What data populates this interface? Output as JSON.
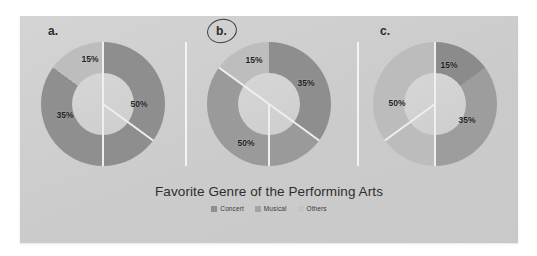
{
  "chart_data": {
    "type": "pie",
    "title": "Favorite Genre of the Performing Arts",
    "subtitle": "",
    "xlabel": "",
    "ylabel": "",
    "legend_position": "bottom",
    "grid": false,
    "categories": [
      "Concert",
      "Musical",
      "Others"
    ],
    "colors": {
      "concert": "#8e8e8e",
      "musical": "#a3a3a3",
      "others": "#bdbdbd",
      "separator": "#efefef",
      "card_background": "#cfcfcf",
      "page_background": "#ffffff",
      "text": "#2e2e2e"
    },
    "charts": [
      {
        "id": "a",
        "label": "a.",
        "annotated": false,
        "slices": [
          {
            "category": "Concert",
            "value": 50,
            "label": "50%",
            "color": "#8e8e8e",
            "start_deg": 0,
            "sweep_deg": 180
          },
          {
            "category": "Musical",
            "value": 35,
            "label": "35%",
            "color": "#8f8f8f",
            "start_deg": 180,
            "sweep_deg": 126
          },
          {
            "category": "Others",
            "value": 15,
            "label": "15%",
            "color": "#bdbdbd",
            "start_deg": 306,
            "sweep_deg": 54
          }
        ]
      },
      {
        "id": "b",
        "label": "b.",
        "annotated": true,
        "annotation": "hand-drawn-ellipse",
        "slices": [
          {
            "category": "Concert",
            "value": 35,
            "label": "35%",
            "color": "#8e8e8e",
            "start_deg": 0,
            "sweep_deg": 126
          },
          {
            "category": "Musical",
            "value": 50,
            "label": "50%",
            "color": "#9a9a9a",
            "start_deg": 126,
            "sweep_deg": 180
          },
          {
            "category": "Others",
            "value": 15,
            "label": "15%",
            "color": "#bdbdbd",
            "start_deg": 306,
            "sweep_deg": 54
          }
        ]
      },
      {
        "id": "c",
        "label": "c.",
        "annotated": false,
        "slices": [
          {
            "category": "Concert",
            "value": 15,
            "label": "15%",
            "color": "#8b8b8b",
            "start_deg": 0,
            "sweep_deg": 54
          },
          {
            "category": "Musical",
            "value": 35,
            "label": "35%",
            "color": "#9d9d9d",
            "start_deg": 54,
            "sweep_deg": 126
          },
          {
            "category": "Others",
            "value": 50,
            "label": "50%",
            "color": "#bcbcbc",
            "start_deg": 180,
            "sweep_deg": 180
          }
        ]
      }
    ]
  },
  "panels": {
    "a": {
      "label": "a.",
      "slice_labels": {
        "right": "50%",
        "left": "35%",
        "top": "15%"
      }
    },
    "b": {
      "label": "b.",
      "slice_labels": {
        "right": "35%",
        "bottom_left": "50%",
        "top": "15%"
      }
    },
    "c": {
      "label": "c.",
      "slice_labels": {
        "top_right": "15%",
        "right": "35%",
        "left": "50%"
      }
    }
  },
  "caption": {
    "title": "Favorite Genre of the Performing Arts"
  },
  "legend": {
    "items": [
      {
        "label": "Concert",
        "color": "#8e8e8e"
      },
      {
        "label": "Musical",
        "color": "#a3a3a3"
      },
      {
        "label": "Others",
        "color": "#c4c4c4"
      }
    ]
  }
}
